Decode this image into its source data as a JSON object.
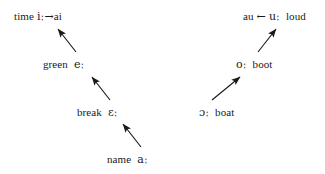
{
  "figure": {
    "type": "vowel-shift-chain-diagram",
    "background_color": "#ffffff",
    "text_color": "#1a1a1a",
    "left_chain": {
      "name": "front-vowel-raising-chain",
      "nodes": [
        {
          "id": "time",
          "word": "time",
          "phoneme": "iː",
          "inline_arrow": "→",
          "result": "ai"
        },
        {
          "id": "green",
          "word": "green",
          "phoneme": "eː"
        },
        {
          "id": "break",
          "word": "break",
          "phoneme": "ɛː"
        },
        {
          "id": "name",
          "word": "name",
          "phoneme": "aː"
        }
      ],
      "edges": [
        {
          "from": "green",
          "to": "time",
          "direction": "up-left"
        },
        {
          "from": "break",
          "to": "green",
          "direction": "up-left"
        },
        {
          "from": "name",
          "to": "break",
          "direction": "up-left"
        }
      ]
    },
    "right_chain": {
      "name": "back-vowel-raising-chain",
      "nodes": [
        {
          "id": "loud",
          "result": "au",
          "inline_arrow": "←",
          "phoneme": "uː",
          "word": "loud"
        },
        {
          "id": "boot",
          "phoneme": "oː",
          "word": "boot"
        },
        {
          "id": "boat",
          "phoneme": "ɔː",
          "word": "boat"
        }
      ],
      "edges": [
        {
          "from": "boot",
          "to": "loud",
          "direction": "up-right"
        },
        {
          "from": "boat",
          "to": "boot",
          "direction": "up-right"
        }
      ]
    }
  }
}
